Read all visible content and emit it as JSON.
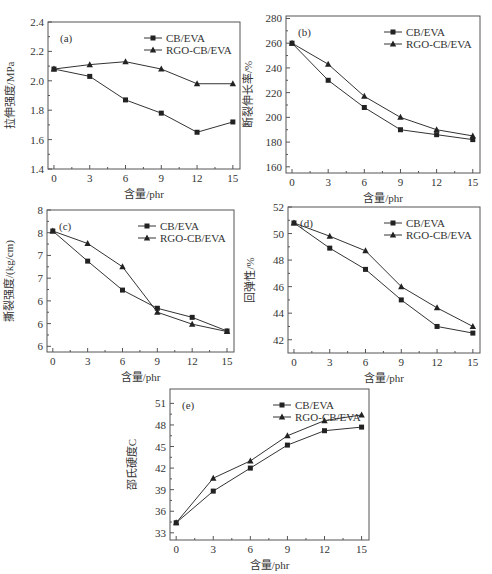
{
  "chart_data": [
    {
      "type": "line",
      "panel_label": "(a)",
      "xlabel": "含量/phr",
      "ylabel": "拉伸强度/MPa",
      "x": [
        0,
        3,
        6,
        9,
        12,
        15
      ],
      "xticks": [
        0,
        3,
        6,
        9,
        12,
        15
      ],
      "ylim": [
        1.4,
        2.4
      ],
      "yticks": [
        1.4,
        1.6,
        1.8,
        2.0,
        2.2,
        2.4
      ],
      "legend_position": "upper right",
      "series": [
        {
          "name": "CB/EVA",
          "marker": "square",
          "values": [
            2.08,
            2.03,
            1.87,
            1.78,
            1.65,
            1.72
          ]
        },
        {
          "name": "RGO-CB/EVA",
          "marker": "triangle",
          "values": [
            2.08,
            2.11,
            2.13,
            2.08,
            1.98,
            1.98
          ]
        }
      ]
    },
    {
      "type": "line",
      "panel_label": "(b)",
      "xlabel": "含量/phr",
      "ylabel": "断裂伸长率/%",
      "x": [
        0,
        3,
        6,
        9,
        12,
        15
      ],
      "xticks": [
        0,
        3,
        6,
        9,
        12,
        15
      ],
      "ylim": [
        155,
        282
      ],
      "yticks": [
        160,
        180,
        200,
        220,
        240,
        260,
        280
      ],
      "legend_position": "upper right",
      "series": [
        {
          "name": "CB/EVA",
          "marker": "square",
          "values": [
            260,
            230,
            208,
            190,
            186,
            182
          ]
        },
        {
          "name": "RGO-CB/EVA",
          "marker": "triangle",
          "values": [
            260,
            243,
            217,
            200,
            190,
            185
          ]
        }
      ]
    },
    {
      "type": "line",
      "panel_label": "(c)",
      "xlabel": "含量/phr",
      "ylabel": "撕裂强度/(kg/cm)",
      "x": [
        0,
        3,
        6,
        9,
        12,
        15
      ],
      "xticks": [
        0,
        3,
        6,
        9,
        12,
        15
      ],
      "ylim": [
        5.5,
        8.0
      ],
      "yticks": [
        5.6,
        6.0,
        6.4,
        6.8,
        7.2,
        7.6,
        8.0
      ],
      "legend_position": "upper right",
      "series": [
        {
          "name": "CB/EVA",
          "marker": "square",
          "values": [
            7.63,
            7.1,
            6.59,
            6.27,
            6.11,
            5.87
          ]
        },
        {
          "name": "RGO-CB/EVA",
          "marker": "triangle",
          "values": [
            7.63,
            7.41,
            7.0,
            6.2,
            5.99,
            5.86
          ]
        }
      ]
    },
    {
      "type": "line",
      "panel_label": "(d)",
      "xlabel": "含量/phr",
      "ylabel": "回弹性/%",
      "x": [
        0,
        3,
        6,
        9,
        12,
        15
      ],
      "xticks": [
        0,
        3,
        6,
        9,
        12,
        15
      ],
      "ylim": [
        41,
        52
      ],
      "yticks": [
        42,
        44,
        46,
        48,
        50,
        52
      ],
      "legend_position": "upper right",
      "series": [
        {
          "name": "CB/EVA",
          "marker": "square",
          "values": [
            50.8,
            48.9,
            47.3,
            45.0,
            43.0,
            42.5
          ]
        },
        {
          "name": "RGO-CB/EVA",
          "marker": "triangle",
          "values": [
            50.8,
            49.8,
            48.7,
            46.0,
            44.4,
            43.0
          ]
        }
      ]
    },
    {
      "type": "line",
      "panel_label": "(e)",
      "xlabel": "含量/phr",
      "ylabel": "邵氏硬度C",
      "x": [
        0,
        3,
        6,
        9,
        12,
        15
      ],
      "xticks": [
        0,
        3,
        6,
        9,
        12,
        15
      ],
      "ylim": [
        32,
        53
      ],
      "yticks": [
        33,
        36,
        39,
        42,
        45,
        48,
        51
      ],
      "legend_position": "upper right",
      "series": [
        {
          "name": "CB/EVA",
          "marker": "square",
          "values": [
            34.4,
            38.8,
            42.0,
            45.2,
            47.2,
            47.7
          ]
        },
        {
          "name": "RGO-CB/EVA",
          "marker": "triangle",
          "values": [
            34.4,
            40.6,
            43.0,
            46.5,
            48.6,
            49.4
          ]
        }
      ]
    }
  ],
  "layout": [
    {
      "left": 48,
      "top": 22,
      "width": 192,
      "height": 147
    },
    {
      "left": 286,
      "top": 16,
      "width": 194,
      "height": 157
    },
    {
      "left": 47,
      "top": 210,
      "width": 187,
      "height": 142
    },
    {
      "left": 288,
      "top": 207,
      "width": 192,
      "height": 146
    },
    {
      "left": 170,
      "top": 389,
      "width": 199,
      "height": 151
    }
  ]
}
